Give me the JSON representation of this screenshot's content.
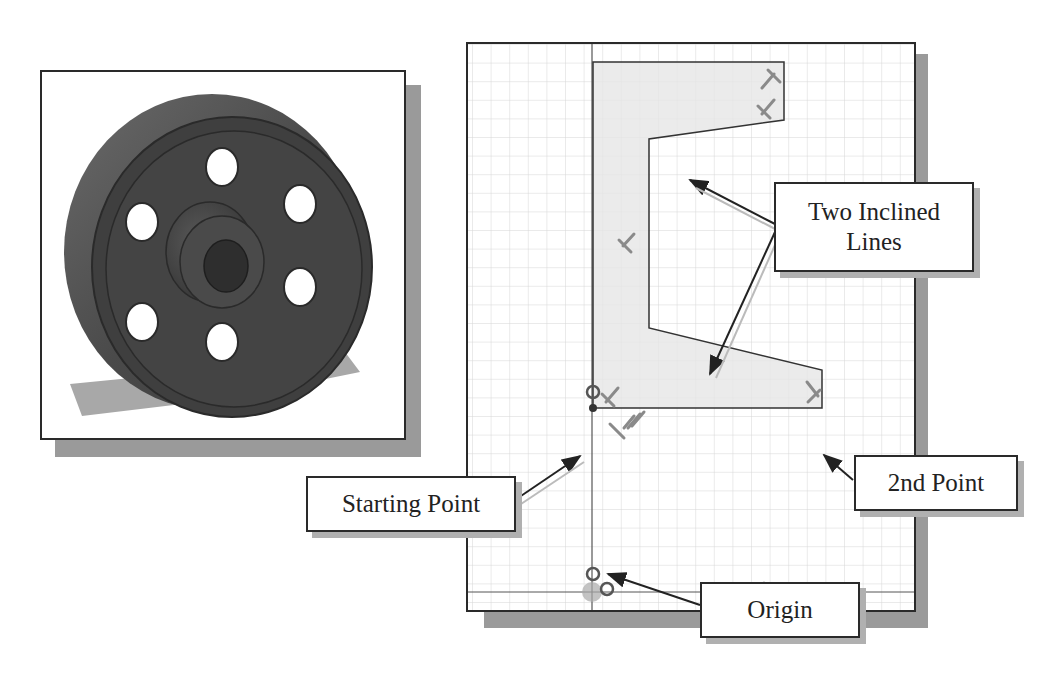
{
  "figure": {
    "left_panel": {
      "subject": "3D flywheel/pulley model with six holes and central hub",
      "frame_color": "#2a2a2a",
      "shadow_color": "#9a9a9a"
    },
    "right_panel": {
      "subject": "2D sketch on grid with closed profile",
      "grid_color": "#d6d6d6",
      "profile_fill": "#e6e6e6",
      "line_color": "#333333",
      "constraint_color": "#8a8a8a"
    },
    "callouts": {
      "two_inclined_lines": {
        "line1": "Two Inclined",
        "line2": "Lines"
      },
      "starting_point": {
        "label": "Starting Point"
      },
      "second_point": {
        "label": "2nd Point"
      },
      "origin": {
        "label": "Origin"
      }
    }
  }
}
